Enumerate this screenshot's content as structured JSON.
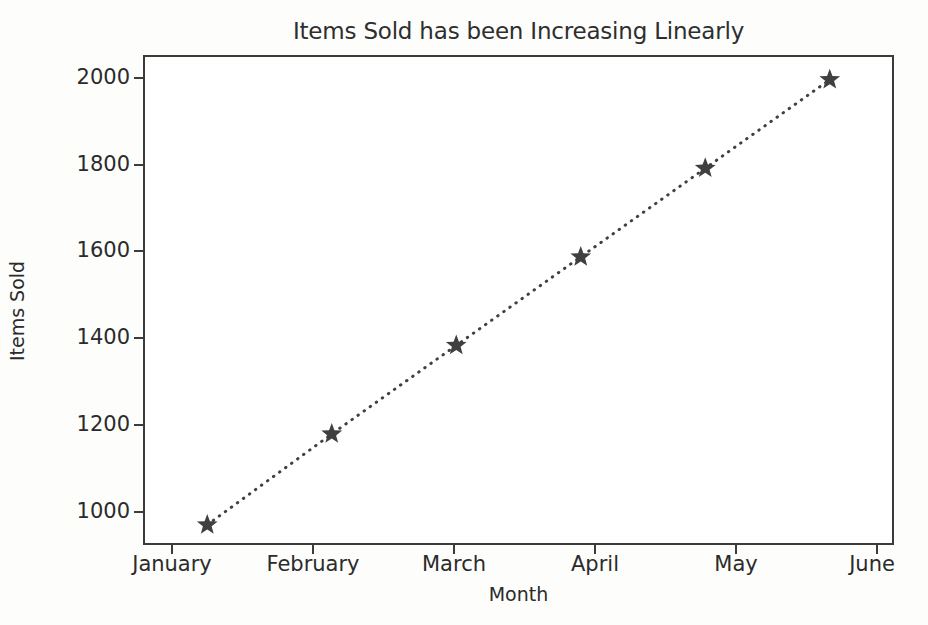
{
  "chart_data": {
    "type": "line",
    "title": "Items Sold has been Increasing Linearly",
    "xlabel": "Month",
    "ylabel": "Items Sold",
    "categories": [
      "January",
      "February",
      "March",
      "April",
      "May",
      "June"
    ],
    "values": [
      1000,
      1200,
      1395,
      1590,
      1785,
      1980
    ],
    "series": [
      {
        "name": "Items Sold",
        "values": [
          1000,
          1200,
          1395,
          1590,
          1785,
          1980
        ],
        "color": "#404040",
        "linestyle": "dotted",
        "marker": "star"
      }
    ],
    "ylim": [
      960,
      2030
    ],
    "yticks": [
      1000,
      1200,
      1400,
      1600,
      1800,
      2000
    ],
    "ytick_labels": [
      "1000",
      "1200",
      "1400",
      "1600",
      "1800",
      "2000"
    ],
    "xtick_labels": [
      "January",
      "February",
      "March",
      "April",
      "May",
      "June"
    ],
    "grid": false,
    "legend": false,
    "legend_position": "none",
    "background_color": "#ffffff",
    "axis_color": "#3b3b3b"
  }
}
